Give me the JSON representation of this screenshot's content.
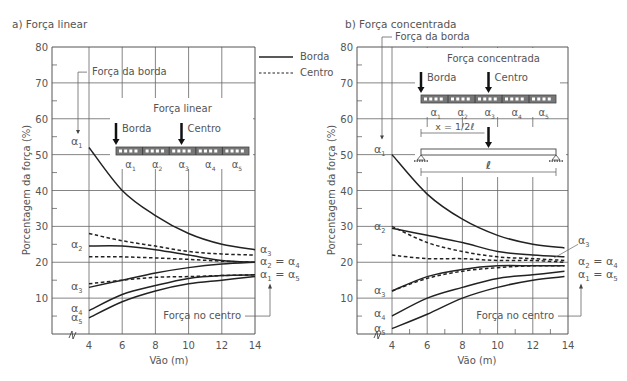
{
  "chart_data": [
    {
      "type": "line",
      "panel_label": "a) Força linear",
      "title": "Força linear",
      "xlabel": "Vão  (m)",
      "ylabel": "Porcentagem da força (%)",
      "x": [
        4,
        6,
        8,
        10,
        12,
        14
      ],
      "xticks": [
        "4",
        "6",
        "8",
        "10",
        "12",
        "14"
      ],
      "yticks": [
        "10",
        "20",
        "30",
        "40",
        "50",
        "60",
        "70",
        "80"
      ],
      "ylim": [
        0,
        80
      ],
      "xlim": [
        2.2,
        14
      ],
      "grid": true,
      "legend": [
        {
          "label": "Borda",
          "style": "solid"
        },
        {
          "label": "Centro",
          "style": "dashed"
        }
      ],
      "series": [
        {
          "name": "Borda α1",
          "style": "solid",
          "values": [
            52,
            40,
            33,
            28,
            25,
            23.5
          ]
        },
        {
          "name": "Borda α2",
          "style": "solid",
          "values": [
            24.5,
            24.5,
            23.5,
            22,
            20.5,
            20
          ]
        },
        {
          "name": "Borda α3",
          "style": "solid",
          "values": [
            13,
            15,
            17,
            18.5,
            19.5,
            20
          ]
        },
        {
          "name": "Borda α4",
          "style": "solid",
          "values": [
            6.5,
            11,
            13.5,
            15.5,
            16.3,
            16.5
          ]
        },
        {
          "name": "Borda α5",
          "style": "solid",
          "values": [
            4.5,
            9,
            12,
            14,
            15,
            16
          ]
        },
        {
          "name": "Centro α3",
          "style": "dashed",
          "values": [
            28,
            26,
            24.5,
            23,
            22.3,
            22
          ]
        },
        {
          "name": "Centro α2 = α4",
          "style": "dashed",
          "values": [
            21.5,
            21.5,
            21.2,
            20.8,
            20.3,
            20
          ]
        },
        {
          "name": "Centro α1 = α5",
          "style": "dashed",
          "values": [
            14,
            15,
            15.8,
            16,
            16.3,
            16.5
          ]
        }
      ],
      "annotations": {
        "edge_force": "Força da borda",
        "center_force": "Força no centro",
        "left_labels": [
          "α1",
          "α2",
          "α3",
          "α4",
          "α5"
        ],
        "right_labels": [
          "α3",
          "α2 = α4",
          "α1 = α5"
        ],
        "inset_title": "Força linear",
        "inset_edge": "Borda",
        "inset_center": "Centro",
        "inset_strips": [
          "α1",
          "α2",
          "α3",
          "α4",
          "α5"
        ]
      }
    },
    {
      "type": "line",
      "panel_label": "b) Força concentrada",
      "title": "Força concentrada",
      "xlabel": "Vão  (m)",
      "ylabel": "Porcentagem da força (%)",
      "x": [
        4,
        6,
        8,
        10,
        12,
        13.8
      ],
      "xticks": [
        "4",
        "6",
        "8",
        "10",
        "12",
        "14"
      ],
      "yticks": [
        "10",
        "20",
        "30",
        "40",
        "50",
        "60",
        "70",
        "80"
      ],
      "ylim": [
        0,
        80
      ],
      "xlim": [
        2,
        14
      ],
      "grid": true,
      "series": [
        {
          "name": "Borda α1",
          "style": "solid",
          "values": [
            50,
            39,
            32,
            27.5,
            25,
            24
          ]
        },
        {
          "name": "Borda α2",
          "style": "solid",
          "values": [
            29.5,
            27.5,
            25.5,
            23,
            22,
            21.5
          ]
        },
        {
          "name": "Borda α3",
          "style": "solid",
          "values": [
            12,
            16,
            18,
            19,
            19,
            19
          ]
        },
        {
          "name": "Borda α4",
          "style": "solid",
          "values": [
            5,
            10,
            13,
            15.5,
            16.5,
            17.5
          ]
        },
        {
          "name": "Borda α5",
          "style": "solid",
          "values": [
            1.5,
            5.5,
            10,
            13,
            15,
            16
          ]
        },
        {
          "name": "Centro α3",
          "style": "dashed",
          "values": [
            30,
            25.5,
            23,
            21.5,
            21,
            20.5
          ]
        },
        {
          "name": "Centro α2 = α4",
          "style": "dashed",
          "values": [
            22,
            21,
            21,
            20.5,
            20.5,
            20
          ]
        },
        {
          "name": "Centro α1 = α5",
          "style": "dashed",
          "values": [
            12,
            15.5,
            17.5,
            18.5,
            19,
            19
          ]
        }
      ],
      "annotations": {
        "edge_force": "Força da borda",
        "center_force": "Força no centro",
        "left_labels": [
          "α1",
          "α2",
          "α3",
          "α4",
          "α5"
        ],
        "right_labels": [
          "α3",
          "α2 = α4",
          "α1 = α5"
        ],
        "inset_title": "Força concentrada",
        "inset_edge": "Borda",
        "inset_center": "Centro",
        "inset_strips": [
          "α1",
          "α2",
          "α3",
          "α4",
          "α5"
        ],
        "beam_position": "x = 1/2ℓ",
        "beam_span": "ℓ"
      }
    }
  ],
  "colors": {
    "line": "#2a2a2a",
    "grid": "#555555",
    "text": "#555555"
  }
}
